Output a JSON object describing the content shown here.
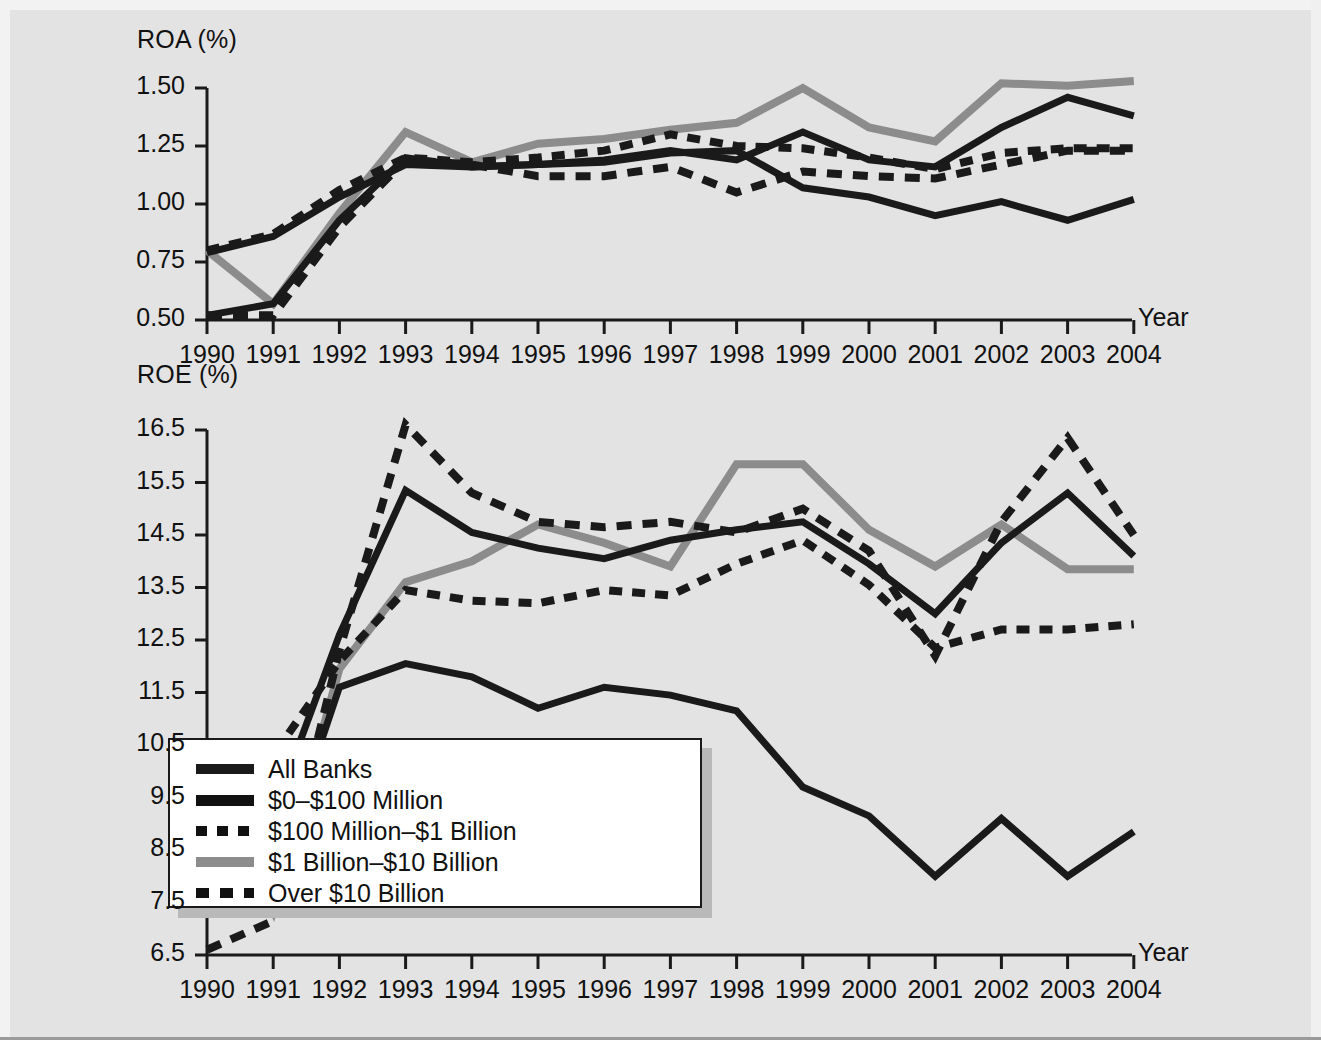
{
  "chart_data": [
    {
      "type": "line",
      "title": "",
      "ylabel": "ROA (%)",
      "xlabel": "Year",
      "categories": [
        "1990",
        "1991",
        "1992",
        "1993",
        "1994",
        "1995",
        "1996",
        "1997",
        "1998",
        "1999",
        "2000",
        "2001",
        "2002",
        "2003",
        "2004"
      ],
      "ylim": [
        0.5,
        1.5
      ],
      "yticks": [
        "0.50",
        "0.75",
        "1.00",
        "1.25",
        "1.50"
      ],
      "grid": false,
      "legend_position": "bottom-chart-inset",
      "series": [
        {
          "name": "All Banks",
          "style": "solid-black",
          "values": [
            0.52,
            0.57,
            0.93,
            1.2,
            1.16,
            1.17,
            1.19,
            1.23,
            1.19,
            1.31,
            1.19,
            1.16,
            1.33,
            1.46,
            1.38
          ]
        },
        {
          "name": "$0–$100 Million",
          "style": "solid-black2",
          "values": [
            0.79,
            0.86,
            1.03,
            1.17,
            1.16,
            1.17,
            1.18,
            1.22,
            1.23,
            1.07,
            1.03,
            0.95,
            1.01,
            0.93,
            1.02
          ]
        },
        {
          "name": "$100 Million–$1 Billion",
          "style": "dashed",
          "values": [
            0.8,
            0.87,
            1.06,
            1.2,
            1.18,
            1.2,
            1.23,
            1.3,
            1.25,
            1.24,
            1.2,
            1.15,
            1.22,
            1.24,
            1.24
          ]
        },
        {
          "name": "$1 Billion–$10 Billion",
          "style": "solid-gray",
          "values": [
            0.8,
            0.57,
            0.96,
            1.31,
            1.18,
            1.26,
            1.28,
            1.32,
            1.35,
            1.5,
            1.33,
            1.27,
            1.52,
            1.51,
            1.53
          ]
        },
        {
          "name": "Over $10 Billion",
          "style": "dashed2",
          "values": [
            0.52,
            0.52,
            0.9,
            1.19,
            1.17,
            1.12,
            1.12,
            1.16,
            1.05,
            1.14,
            1.12,
            1.11,
            1.17,
            1.23,
            1.23
          ]
        }
      ]
    },
    {
      "type": "line",
      "title": "",
      "ylabel": "ROE (%)",
      "xlabel": "Year",
      "categories": [
        "1990",
        "1991",
        "1992",
        "1993",
        "1994",
        "1995",
        "1996",
        "1997",
        "1998",
        "1999",
        "2000",
        "2001",
        "2002",
        "2003",
        "2004"
      ],
      "ylim": [
        6.5,
        16.5
      ],
      "yticks": [
        "6.5",
        "7.5",
        "8.5",
        "9.5",
        "10.5",
        "11.5",
        "12.5",
        "13.5",
        "14.5",
        "15.5",
        "16.5"
      ],
      "grid": false,
      "legend_position": "inset-lower-left",
      "series": [
        {
          "name": "All Banks",
          "style": "solid-black",
          "values": [
            8.98,
            9.18,
            12.6,
            15.35,
            14.55,
            14.25,
            14.05,
            14.4,
            14.6,
            14.75,
            13.95,
            13.0,
            14.35,
            15.3,
            14.1
          ]
        },
        {
          "name": "$0–$100 Million",
          "style": "solid-black2",
          "values": [
            7.65,
            7.85,
            11.6,
            12.05,
            11.8,
            11.2,
            11.6,
            11.45,
            11.15,
            9.7,
            9.15,
            8.0,
            9.1,
            8.0,
            8.85
          ]
        },
        {
          "name": "$100 Million–$1 Billion",
          "style": "dashed",
          "values": [
            9.2,
            10.3,
            12.1,
            13.45,
            13.25,
            13.2,
            13.45,
            13.35,
            13.95,
            14.4,
            13.55,
            12.35,
            12.7,
            12.7,
            12.8
          ]
        },
        {
          "name": "$1 Billion–$10 Billion",
          "style": "solid-gray",
          "values": [
            10.05,
            7.35,
            11.95,
            13.6,
            14.0,
            14.7,
            14.35,
            13.9,
            15.85,
            15.85,
            14.6,
            13.9,
            14.7,
            13.85,
            13.85
          ]
        },
        {
          "name": "Over $10 Billion",
          "style": "dashed2",
          "values": [
            6.6,
            7.15,
            12.3,
            16.6,
            15.3,
            14.75,
            14.65,
            14.75,
            14.55,
            15.0,
            14.2,
            12.2,
            14.75,
            16.35,
            14.5
          ]
        }
      ]
    }
  ],
  "top_chart": {
    "y_axis_title": "ROA (%)",
    "x_axis_title": "Year",
    "y_ticks": [
      "1.50",
      "1.25",
      "1.00",
      "0.75",
      "0.50"
    ],
    "x_ticks": [
      "1990",
      "1991",
      "1992",
      "1993",
      "1994",
      "1995",
      "1996",
      "1997",
      "1998",
      "1999",
      "2000",
      "2001",
      "2002",
      "2003",
      "2004"
    ]
  },
  "bottom_chart": {
    "y_axis_title": "ROE (%)",
    "x_axis_title": "Year",
    "y_ticks": [
      "16.5",
      "15.5",
      "14.5",
      "13.5",
      "12.5",
      "11.5",
      "10.5",
      "9.5",
      "8.5",
      "7.5",
      "6.5"
    ],
    "x_ticks": [
      "1990",
      "1991",
      "1992",
      "1993",
      "1994",
      "1995",
      "1996",
      "1997",
      "1998",
      "1999",
      "2000",
      "2001",
      "2002",
      "2003",
      "2004"
    ]
  },
  "legend": {
    "items": [
      {
        "label": "All Banks",
        "style": "solid-black"
      },
      {
        "label": "$0–$100 Million",
        "style": "solid-black2"
      },
      {
        "label": "$100 Million–$1 Billion",
        "style": "dashed"
      },
      {
        "label": "$1 Billion–$10 Billion",
        "style": "solid-gray"
      },
      {
        "label": "Over $10 Billion",
        "style": "dashed2"
      }
    ]
  },
  "colors": {
    "background": "#e3e3e3",
    "line_black": "#1a1a1a",
    "line_gray": "#8c8c8c",
    "axis": "#1a1a1a",
    "legend_background": "#ffffff",
    "legend_shadow": "#b9b9b9"
  }
}
